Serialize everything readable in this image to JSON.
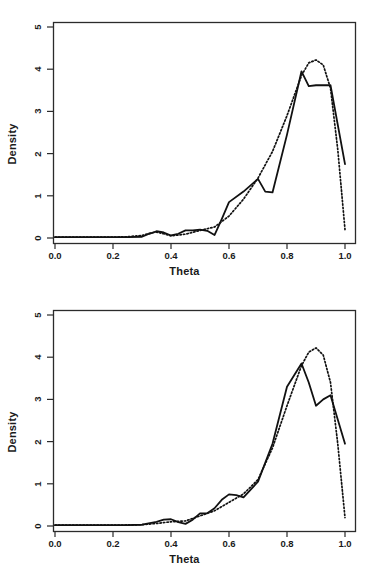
{
  "figure": {
    "panel_count": 2,
    "background": "#ffffff",
    "line_color": "#111111"
  },
  "chart_data": [
    {
      "type": "line",
      "panel": "top",
      "title": "",
      "xlabel": "Theta",
      "ylabel": "Density",
      "xlim": [
        0.0,
        1.0
      ],
      "ylim": [
        0.0,
        5.2
      ],
      "xticks": [
        0.0,
        0.2,
        0.4,
        0.6,
        0.8,
        1.0
      ],
      "xtick_labels": [
        "0.0",
        "0.2",
        "0.4",
        "0.6",
        "0.8",
        "1.0"
      ],
      "yticks": [
        0,
        1,
        2,
        3,
        4,
        5
      ],
      "ytick_labels": [
        "0",
        "1",
        "2",
        "3",
        "4",
        "5"
      ],
      "grid": false,
      "legend": "none",
      "series": [
        {
          "name": "empirical density",
          "style": "solid",
          "x": [
            0.0,
            0.05,
            0.1,
            0.15,
            0.2,
            0.25,
            0.3,
            0.325,
            0.35,
            0.375,
            0.4,
            0.425,
            0.45,
            0.475,
            0.5,
            0.525,
            0.55,
            0.575,
            0.6,
            0.65,
            0.7,
            0.725,
            0.75,
            0.8,
            0.85,
            0.875,
            0.9,
            0.95,
            1.0
          ],
          "y": [
            0.02,
            0.02,
            0.02,
            0.02,
            0.02,
            0.02,
            0.03,
            0.1,
            0.16,
            0.13,
            0.06,
            0.1,
            0.18,
            0.18,
            0.2,
            0.17,
            0.07,
            0.45,
            0.85,
            1.1,
            1.4,
            1.1,
            1.08,
            2.45,
            3.95,
            3.6,
            3.62,
            3.62,
            1.75
          ]
        },
        {
          "name": "fitted density",
          "style": "dotted",
          "x": [
            0.0,
            0.1,
            0.2,
            0.25,
            0.3,
            0.325,
            0.35,
            0.375,
            0.4,
            0.45,
            0.5,
            0.55,
            0.6,
            0.65,
            0.7,
            0.75,
            0.8,
            0.85,
            0.875,
            0.9,
            0.925,
            0.95,
            0.975,
            1.0
          ],
          "y": [
            0.02,
            0.02,
            0.02,
            0.03,
            0.06,
            0.11,
            0.14,
            0.1,
            0.05,
            0.09,
            0.18,
            0.26,
            0.52,
            0.92,
            1.42,
            2.05,
            2.9,
            3.85,
            4.15,
            4.22,
            4.1,
            3.55,
            2.1,
            0.2
          ]
        }
      ]
    },
    {
      "type": "line",
      "panel": "bottom",
      "title": "",
      "xlabel": "Theta",
      "ylabel": "Density",
      "xlim": [
        0.0,
        1.0
      ],
      "ylim": [
        0.0,
        5.2
      ],
      "xticks": [
        0.0,
        0.2,
        0.4,
        0.6,
        0.8,
        1.0
      ],
      "xtick_labels": [
        "0.0",
        "0.2",
        "0.4",
        "0.6",
        "0.8",
        "1.0"
      ],
      "yticks": [
        0,
        1,
        2,
        3,
        4,
        5
      ],
      "ytick_labels": [
        "0",
        "1",
        "2",
        "3",
        "4",
        "5"
      ],
      "grid": false,
      "legend": "none",
      "series": [
        {
          "name": "empirical density",
          "style": "solid",
          "x": [
            0.0,
            0.05,
            0.1,
            0.15,
            0.2,
            0.25,
            0.3,
            0.35,
            0.375,
            0.4,
            0.425,
            0.45,
            0.475,
            0.5,
            0.525,
            0.55,
            0.575,
            0.6,
            0.625,
            0.65,
            0.7,
            0.75,
            0.8,
            0.85,
            0.875,
            0.9,
            0.925,
            0.95,
            1.0
          ],
          "y": [
            0.02,
            0.02,
            0.02,
            0.02,
            0.02,
            0.02,
            0.03,
            0.1,
            0.15,
            0.16,
            0.09,
            0.05,
            0.15,
            0.3,
            0.3,
            0.42,
            0.62,
            0.75,
            0.73,
            0.68,
            1.05,
            1.95,
            3.3,
            3.85,
            3.4,
            2.85,
            3.0,
            3.1,
            1.95
          ]
        },
        {
          "name": "fitted density",
          "style": "dotted",
          "x": [
            0.0,
            0.1,
            0.2,
            0.3,
            0.35,
            0.4,
            0.45,
            0.5,
            0.55,
            0.6,
            0.65,
            0.7,
            0.75,
            0.8,
            0.85,
            0.875,
            0.9,
            0.925,
            0.95,
            0.975,
            1.0
          ],
          "y": [
            0.02,
            0.02,
            0.02,
            0.03,
            0.06,
            0.1,
            0.12,
            0.24,
            0.36,
            0.56,
            0.76,
            1.1,
            1.85,
            2.85,
            3.8,
            4.12,
            4.22,
            4.05,
            3.4,
            1.95,
            0.2
          ]
        }
      ]
    }
  ]
}
